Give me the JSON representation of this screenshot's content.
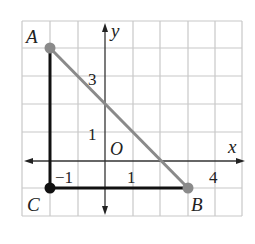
{
  "diagram": {
    "type": "coordinate-plane-triangle",
    "axes": {
      "x_label": "x",
      "y_label": "y",
      "origin_label": "O",
      "tick_labels": {
        "x_neg1": "−1",
        "x_1": "1",
        "x_4": "4",
        "y_1": "1",
        "y_3": "3"
      }
    },
    "points": {
      "A": {
        "label": "A",
        "coords": [
          -2,
          4
        ]
      },
      "B": {
        "label": "B",
        "coords": [
          3,
          -1
        ]
      },
      "C": {
        "label": "C",
        "coords": [
          -2,
          -1
        ]
      }
    },
    "segments": [
      {
        "from": "A",
        "to": "C",
        "style": "black"
      },
      {
        "from": "C",
        "to": "B",
        "style": "black"
      },
      {
        "from": "A",
        "to": "B",
        "style": "gray"
      }
    ],
    "colors": {
      "grid": "#c8c8c8",
      "axis": "#333333",
      "leg": "#111111",
      "hypotenuse": "#8a8a8a",
      "point_gray": "#8a8a8a",
      "point_black": "#111111"
    }
  }
}
